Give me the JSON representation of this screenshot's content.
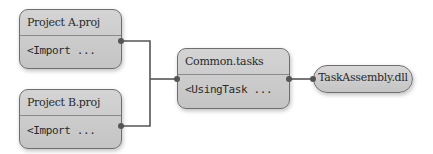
{
  "diagram": {
    "nodes": {
      "project_a": {
        "title": "Project A.proj",
        "body": "<Import ..."
      },
      "project_b": {
        "title": "Project B.proj",
        "body": "<Import ..."
      },
      "common": {
        "title": "Common.tasks",
        "body": "<UsingTask ..."
      },
      "assembly": {
        "label": "TaskAssembly.dll"
      }
    },
    "edges": [
      {
        "from": "project_a",
        "to": "common"
      },
      {
        "from": "project_b",
        "to": "common"
      },
      {
        "from": "common",
        "to": "assembly"
      }
    ],
    "colors": {
      "node_fill": "#cccccc",
      "node_border": "#6e6e6e",
      "line": "#555555",
      "text": "#2a2a2a"
    }
  }
}
